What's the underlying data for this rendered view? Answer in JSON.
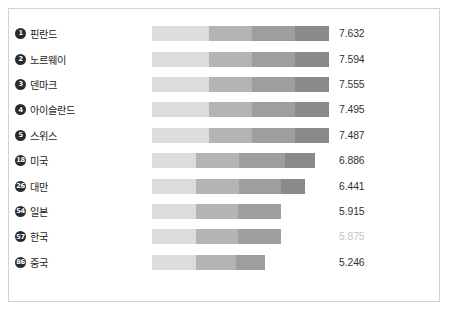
{
  "chart_data": {
    "type": "bar",
    "title": "",
    "subtitle": "",
    "xlabel": "",
    "ylabel": "",
    "orientation": "horizontal",
    "stacked": true,
    "grid": false,
    "legend": "none",
    "xlim": [
      0,
      8
    ],
    "value_precision": 3,
    "categories": [
      "핀란드",
      "노르웨이",
      "덴마크",
      "아이슬란드",
      "스위스",
      "미국",
      "대만",
      "일본",
      "한국",
      "중국"
    ],
    "values": [
      7.632,
      7.594,
      7.555,
      7.495,
      7.487,
      6.886,
      6.441,
      5.915,
      5.875,
      5.246
    ],
    "segment_colors": [
      "#dcdcdc",
      "#b4b4b4",
      "#9e9e9e",
      "#8a8a8a"
    ],
    "rows": [
      {
        "rank": "1",
        "country": "핀란드",
        "value": "7.632",
        "value_muted": false,
        "bar_width": 177,
        "segments": [
          57,
          43,
          43,
          34
        ]
      },
      {
        "rank": "2",
        "country": "노르웨이",
        "value": "7.594",
        "value_muted": false,
        "bar_width": 177,
        "segments": [
          57,
          43,
          43,
          34
        ]
      },
      {
        "rank": "3",
        "country": "덴마크",
        "value": "7.555",
        "value_muted": false,
        "bar_width": 177,
        "segments": [
          57,
          43,
          43,
          34
        ]
      },
      {
        "rank": "4",
        "country": "아이슬란드",
        "value": "7.495",
        "value_muted": false,
        "bar_width": 177,
        "segments": [
          57,
          43,
          43,
          34
        ]
      },
      {
        "rank": "5",
        "country": "스위스",
        "value": "7.487",
        "value_muted": false,
        "bar_width": 177,
        "segments": [
          57,
          43,
          43,
          34
        ]
      },
      {
        "rank": "18",
        "country": "미국",
        "value": "6.886",
        "value_muted": false,
        "bar_width": 163,
        "segments": [
          44,
          43,
          46,
          30
        ]
      },
      {
        "rank": "26",
        "country": "대만",
        "value": "6.441",
        "value_muted": false,
        "bar_width": 153,
        "segments": [
          44,
          43,
          42,
          24
        ]
      },
      {
        "rank": "54",
        "country": "일본",
        "value": "5.915",
        "value_muted": false,
        "bar_width": 129,
        "segments": [
          44,
          42,
          43
        ]
      },
      {
        "rank": "57",
        "country": "한국",
        "value": "5.875",
        "value_muted": true,
        "bar_width": 129,
        "segments": [
          44,
          42,
          43
        ]
      },
      {
        "rank": "86",
        "country": "중국",
        "value": "5.246",
        "value_muted": false,
        "bar_width": 113,
        "segments": [
          44,
          40,
          29
        ]
      }
    ]
  }
}
